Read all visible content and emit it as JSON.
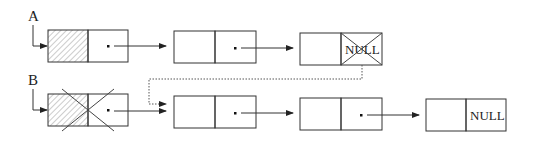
{
  "diagram": {
    "type": "linked-list",
    "pointers": [
      {
        "label": "A",
        "points_to": "A1"
      },
      {
        "label": "B",
        "points_to": "B1"
      }
    ],
    "lists": {
      "A": [
        {
          "id": "A1",
          "data_hatched": true,
          "next": "A2",
          "crossed_out": false
        },
        {
          "id": "A2",
          "data_hatched": false,
          "next": "A3",
          "crossed_out": false
        },
        {
          "id": "A3",
          "data_hatched": false,
          "next_text": "NULL",
          "next_crossed_out": true
        }
      ],
      "B": [
        {
          "id": "B1",
          "data_hatched": true,
          "next": "B2",
          "crossed_out": true
        },
        {
          "id": "B2",
          "data_hatched": false,
          "next": "B3",
          "crossed_out": false
        },
        {
          "id": "B3",
          "data_hatched": false,
          "next": "B4",
          "crossed_out": false
        },
        {
          "id": "B4",
          "data_hatched": false,
          "next_text": "NULL"
        }
      ]
    },
    "new_link": {
      "from": "A3",
      "to": "B2",
      "style": "dotted"
    },
    "labels": {
      "pointer_a": "A",
      "pointer_b": "B",
      "null_a3": "NULL",
      "null_b4": "NULL"
    },
    "colors": {
      "stroke": "#333333",
      "hatch": "#888888",
      "background": "#ffffff"
    }
  }
}
